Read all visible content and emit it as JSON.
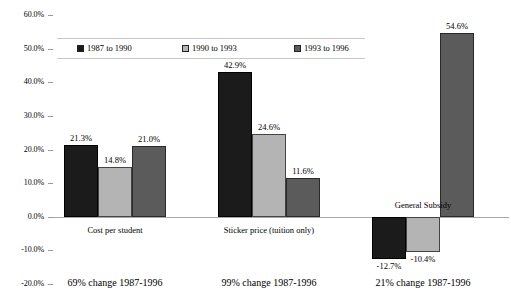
{
  "chart_data": {
    "type": "bar",
    "title": "",
    "xlabel": "",
    "ylabel": "",
    "ylim": [
      -20,
      60
    ],
    "ytick_step": 10,
    "grid": false,
    "legend_position": "top",
    "categories": [
      "Cost per student",
      "Sticker price (tuition only)",
      "General Subsidy"
    ],
    "ytick_labels": [
      "60.0%",
      "50.0%",
      "40.0%",
      "30.0%",
      "20.0%",
      "10.0%",
      "0.0%",
      "-10.0%",
      "-20.0%"
    ],
    "ytick_values": [
      60,
      50,
      40,
      30,
      20,
      10,
      0,
      -10,
      -20
    ],
    "series": [
      {
        "name": "1987 to 1990",
        "color": "#1b1b1b",
        "values": [
          21.3,
          42.9,
          -12.7
        ],
        "labels": [
          "21.3%",
          "42.9%",
          "-12.7%"
        ]
      },
      {
        "name": "1990 to 1993",
        "color": "#b4b4b4",
        "values": [
          14.8,
          24.6,
          -10.4
        ],
        "labels": [
          "14.8%",
          "24.6%",
          "-10.4%"
        ]
      },
      {
        "name": "1993 to 1996",
        "color": "#5b5b5b",
        "values": [
          21.0,
          11.6,
          54.6
        ],
        "labels": [
          "21.0%",
          "11.6%",
          "54.6%"
        ]
      }
    ],
    "annotations": [
      "69% change 1987-1996",
      "99% change 1987-1996",
      "21% change 1987-1996"
    ]
  }
}
